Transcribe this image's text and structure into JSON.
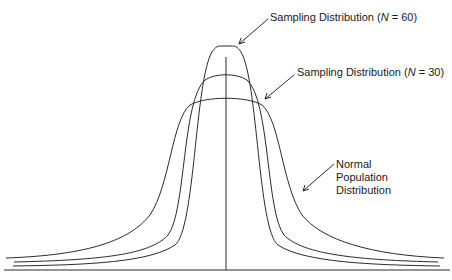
{
  "diagram": {
    "title": "",
    "labels": {
      "n60": {
        "prefix": "Sampling Distribution (",
        "var": "N",
        "suffix": " = 60)"
      },
      "n30": {
        "prefix": "Sampling Distribution (",
        "var": "N",
        "suffix": " = 30)"
      },
      "normal": {
        "line1": "Normal",
        "line2": "Population",
        "line3": "Distribution"
      }
    },
    "curves": [
      {
        "name": "Sampling Distribution (N = 60)",
        "peak_height": "tallest",
        "spread": "narrowest"
      },
      {
        "name": "Sampling Distribution (N = 30)",
        "peak_height": "middle",
        "spread": "middle"
      },
      {
        "name": "Normal Population Distribution",
        "peak_height": "lowest",
        "spread": "widest"
      }
    ],
    "colors": {
      "line": "#2b2b2b",
      "background": "#ffffff"
    }
  }
}
